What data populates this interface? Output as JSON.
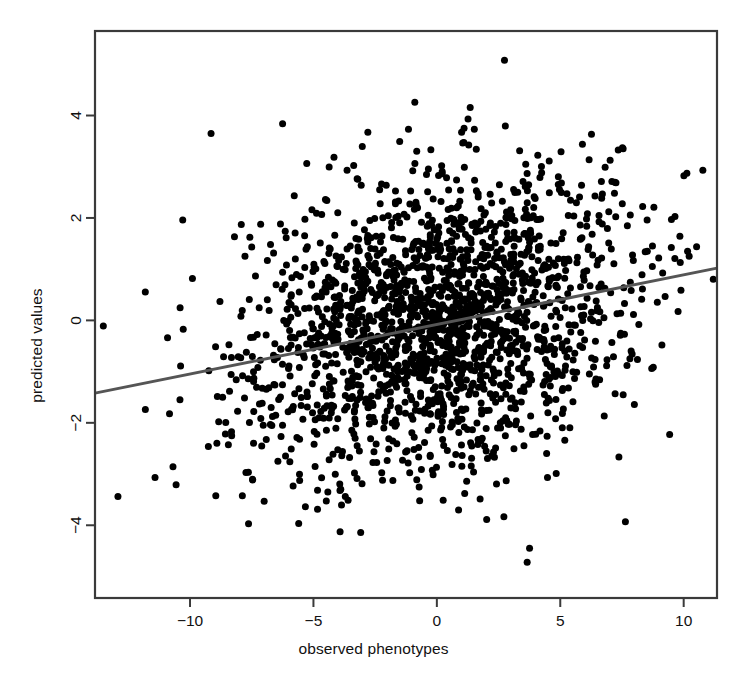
{
  "chart_data": {
    "type": "scatter",
    "title": "",
    "subtitle": "",
    "xlabel": "observed phenotypes",
    "ylabel": "predicted values",
    "xlim": [
      -13.85,
      11.35
    ],
    "ylim": [
      -5.42,
      5.65
    ],
    "xticks": [
      -10,
      -5,
      0,
      5,
      10
    ],
    "xtick_labels": [
      "-10",
      "-5",
      "0",
      "5",
      "10"
    ],
    "yticks": [
      -4,
      -2,
      0,
      2,
      4
    ],
    "ytick_labels": [
      "-4",
      "-2",
      "0",
      "2",
      "4"
    ],
    "grid": false,
    "legend": null,
    "legend_position": "none",
    "point_color": "#000000",
    "point_marker": "filled-circle",
    "point_size_px": 7,
    "n_points": 2000,
    "series": [
      {
        "name": "observations",
        "x_mean": 0.0,
        "x_sd": 3.9,
        "y_mean": 0.0,
        "y_sd": 1.45,
        "correlation": 0.26
      }
    ],
    "annotations": [],
    "trendline": {
      "type": "linear-fit",
      "color": "#555555",
      "width_px": 3,
      "x_start": -13.85,
      "y_start": -1.42,
      "x_end": 11.35,
      "y_end": 1.02,
      "slope": 0.0968,
      "intercept": -0.081
    },
    "axis_style": {
      "box": true,
      "box_color": "#3a3a3a",
      "tick_direction": "out",
      "tick_length_px": 9
    }
  },
  "figure": {
    "background": "#ffffff",
    "width": 747,
    "height": 691,
    "plot_area": {
      "left": 95,
      "top": 31,
      "right": 717,
      "bottom": 598
    }
  }
}
